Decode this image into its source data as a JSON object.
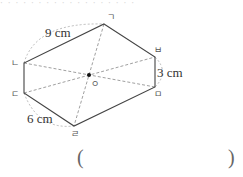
{
  "top_strip": {
    "text": "· · · · · · · · · · · · · · · · · ·"
  },
  "figure": {
    "shape": "point-symmetric hexagon",
    "center": {
      "label": "ㅇ",
      "x": 89,
      "y": 75
    },
    "vertices": [
      {
        "label": "ㄱ",
        "x": 104,
        "y": 24
      },
      {
        "label": "ㅂ",
        "x": 155,
        "y": 57
      },
      {
        "label": "ㅁ",
        "x": 155,
        "y": 87
      },
      {
        "label": "ㄹ",
        "x": 74,
        "y": 126
      },
      {
        "label": "ㄷ",
        "x": 24,
        "y": 93
      },
      {
        "label": "ㄴ",
        "x": 24,
        "y": 63
      }
    ],
    "side_labels": {
      "nieun_giyeok": "9 cm",
      "bieup_mieum": "3 cm",
      "digeut_rieul": "6 cm"
    },
    "colors": {
      "edge": "#444444",
      "dashed": "#888888",
      "arc": "#aaaaaa"
    }
  },
  "answer": {
    "open": "(",
    "close": ")"
  }
}
